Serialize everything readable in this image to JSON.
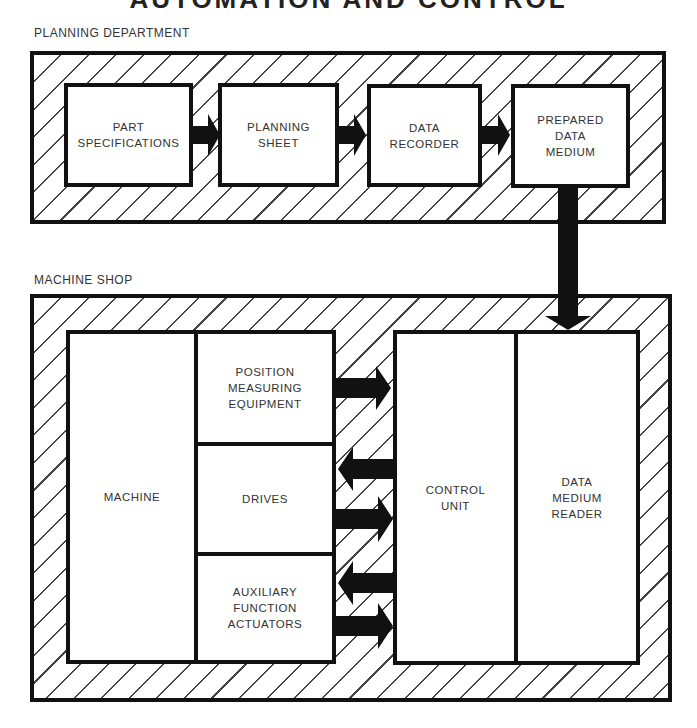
{
  "header": {
    "title_clipped": "AUTOMATION AND CONTROL"
  },
  "planning": {
    "label": "PLANNING DEPARTMENT",
    "boxes": [
      {
        "label": "PART\nSPECIFICATIONS"
      },
      {
        "label": "PLANNING\nSHEET"
      },
      {
        "label": "DATA\nRECORDER"
      },
      {
        "label": "PREPARED\nDATA\nMEDIUM"
      }
    ]
  },
  "shop": {
    "label": "MACHINE SHOP",
    "machine": "MACHINE",
    "subsystems": [
      {
        "label": "POSITION\nMEASURING\nEQUIPMENT"
      },
      {
        "label": "DRIVES"
      },
      {
        "label": "AUXILIARY\nFUNCTION\nACTUATORS"
      }
    ],
    "control_unit": "CONTROL\nUNIT",
    "reader": "DATA\nMEDIUM\nREADER"
  },
  "arrows": [
    {
      "from": "PART SPECIFICATIONS",
      "to": "PLANNING SHEET",
      "direction": "right"
    },
    {
      "from": "PLANNING SHEET",
      "to": "DATA RECORDER",
      "direction": "right"
    },
    {
      "from": "DATA RECORDER",
      "to": "PREPARED DATA MEDIUM",
      "direction": "right"
    },
    {
      "from": "PREPARED DATA MEDIUM",
      "to": "DATA MEDIUM READER",
      "direction": "down"
    },
    {
      "from": "POSITION MEASURING EQUIPMENT",
      "to": "CONTROL UNIT",
      "direction": "right"
    },
    {
      "from": "CONTROL UNIT",
      "to": "DRIVES",
      "direction": "left"
    },
    {
      "from": "DRIVES",
      "to": "CONTROL UNIT",
      "direction": "right"
    },
    {
      "from": "CONTROL UNIT",
      "to": "AUXILIARY FUNCTION ACTUATORS",
      "direction": "left"
    },
    {
      "from": "AUXILIARY FUNCTION ACTUATORS",
      "to": "CONTROL UNIT",
      "direction": "right"
    }
  ],
  "colors": {
    "line": "#111111",
    "hatch": "#444444",
    "text": "#333333",
    "background": "#ffffff"
  }
}
